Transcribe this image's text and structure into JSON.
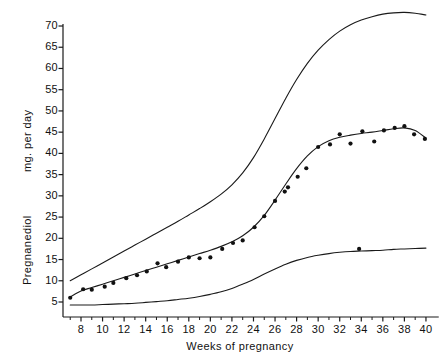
{
  "chart_data": {
    "type": "line",
    "title": "",
    "xlabel": "Weeks of pregnancy",
    "ylabel": "Pregnanediol",
    "ylabel2": "mg. per day",
    "xlim": [
      6,
      41
    ],
    "ylim": [
      3,
      72
    ],
    "xticks": [
      8,
      10,
      12,
      14,
      16,
      18,
      20,
      22,
      24,
      26,
      28,
      30,
      32,
      34,
      36,
      38,
      40
    ],
    "xticklabels": [
      "8",
      "10",
      "12",
      "14",
      "16",
      "18",
      "20",
      "22",
      "24",
      "26",
      "28",
      "30",
      "32",
      "34",
      "36",
      "38",
      "40"
    ],
    "xminorticks": [
      7,
      9,
      11,
      13,
      15,
      17,
      19,
      21,
      23,
      25,
      27,
      29,
      31,
      33,
      35,
      37,
      39
    ],
    "yticks": [
      5,
      10,
      15,
      20,
      25,
      30,
      35,
      40,
      45,
      50,
      55,
      60,
      65,
      70
    ],
    "yticklabels": [
      "5",
      "10",
      "15",
      "20",
      "25",
      "30",
      "35",
      "40",
      "45",
      "50",
      "55",
      "60",
      "65",
      "70"
    ],
    "grid": false,
    "legend": false,
    "legend_position": "none",
    "series": [
      {
        "name": "Upper limit",
        "type": "line",
        "color": "#1a1a1a",
        "x": [
          7,
          8,
          9,
          10,
          11,
          12,
          13,
          14,
          15,
          16,
          17,
          18,
          19,
          20,
          21,
          22,
          23,
          24,
          25,
          26,
          27,
          28,
          29,
          30,
          31,
          32,
          33,
          34,
          35,
          36,
          37,
          38,
          39,
          40
        ],
        "values": [
          10.0,
          11.4,
          12.8,
          14.2,
          15.6,
          17.0,
          18.4,
          19.8,
          21.2,
          22.6,
          24.0,
          25.5,
          27.0,
          28.6,
          30.4,
          32.6,
          35.4,
          39.0,
          43.4,
          48.2,
          53.0,
          57.4,
          61.2,
          64.3,
          66.8,
          68.8,
          70.3,
          71.4,
          72.2,
          72.8,
          73.1,
          73.2,
          73.0,
          72.6
        ]
      },
      {
        "name": "Mean fitted curve",
        "type": "line",
        "color": "#1a1a1a",
        "x": [
          7,
          8,
          9,
          10,
          11,
          12,
          13,
          14,
          15,
          16,
          17,
          18,
          19,
          20,
          21,
          22,
          23,
          24,
          25,
          26,
          27,
          28,
          29,
          30,
          31,
          32,
          33,
          34,
          35,
          36,
          37,
          38,
          39,
          40
        ],
        "values": [
          6.2,
          7.6,
          8.4,
          9.2,
          10.0,
          10.8,
          11.6,
          12.4,
          13.2,
          14.0,
          14.8,
          15.6,
          16.4,
          17.2,
          18.1,
          19.2,
          20.6,
          22.6,
          25.4,
          29.0,
          32.8,
          36.4,
          39.4,
          41.6,
          43.0,
          43.8,
          44.3,
          44.7,
          45.0,
          45.4,
          45.8,
          46.0,
          45.4,
          43.6
        ]
      },
      {
        "name": "Lower limit",
        "type": "line",
        "color": "#1a1a1a",
        "x": [
          7,
          8,
          9,
          10,
          11,
          12,
          13,
          14,
          15,
          16,
          17,
          18,
          19,
          20,
          21,
          22,
          23,
          24,
          25,
          26,
          27,
          28,
          29,
          30,
          31,
          32,
          33,
          34,
          35,
          36,
          37,
          38,
          39,
          40
        ],
        "values": [
          4.3,
          4.3,
          4.3,
          4.4,
          4.5,
          4.6,
          4.7,
          4.9,
          5.1,
          5.3,
          5.6,
          5.9,
          6.3,
          6.8,
          7.4,
          8.2,
          9.2,
          10.3,
          11.6,
          12.8,
          13.9,
          14.8,
          15.5,
          16.0,
          16.4,
          16.7,
          16.9,
          17.0,
          17.1,
          17.2,
          17.4,
          17.5,
          17.6,
          17.7
        ]
      },
      {
        "name": "Observed means",
        "type": "scatter",
        "color": "#111111",
        "marker": "filled-circle",
        "x": [
          7.0,
          8.2,
          9.0,
          10.2,
          11.0,
          12.2,
          13.2,
          14.1,
          15.1,
          15.9,
          17.0,
          18.0,
          19.0,
          20.0,
          21.1,
          22.1,
          23.0,
          24.1,
          25.0,
          26.0,
          26.9,
          27.2,
          28.1,
          28.9,
          30.0,
          31.1,
          32.0,
          33.0,
          34.1,
          35.2,
          36.1,
          37.1,
          38.0,
          38.9,
          39.9,
          33.8
        ],
        "values": [
          6.0,
          8.0,
          7.9,
          8.6,
          9.5,
          10.6,
          11.3,
          12.2,
          14.1,
          13.2,
          14.5,
          15.5,
          15.3,
          15.5,
          17.5,
          18.9,
          19.5,
          22.6,
          25.2,
          28.8,
          31.0,
          32.0,
          34.5,
          36.5,
          41.5,
          42.1,
          44.5,
          42.3,
          45.2,
          42.8,
          45.4,
          46.0,
          46.4,
          44.5,
          43.4,
          17.5
        ]
      }
    ]
  }
}
